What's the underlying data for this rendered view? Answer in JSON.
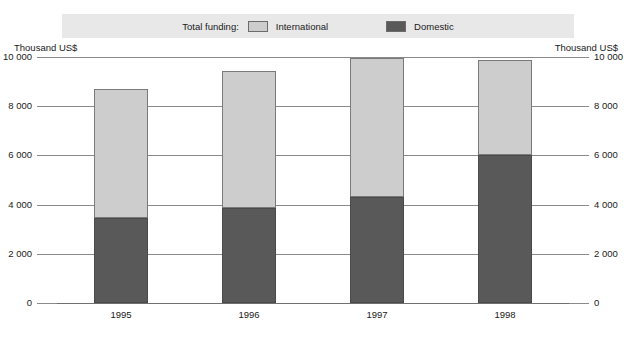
{
  "legend": {
    "title": "Total funding:",
    "entries": [
      {
        "label": "International",
        "swatch": "international-swatch",
        "color": "#cdcdcd"
      },
      {
        "label": "Domestic",
        "swatch": "domestic-swatch",
        "color": "#595959"
      }
    ]
  },
  "axes": {
    "left_caption": "Thousand US$",
    "right_caption": "Thousand US$",
    "tick_labels": [
      "10 000",
      "8 000",
      "6 000",
      "4 000",
      "2 000",
      "0"
    ]
  },
  "chart_data": {
    "type": "bar",
    "stacked": true,
    "title": "",
    "subtitle": "",
    "xlabel": "",
    "ylabel": "Thousand US$",
    "ylim": [
      0,
      10000
    ],
    "yticks": [
      0,
      2000,
      4000,
      6000,
      8000,
      10000
    ],
    "ytick_labels": [
      "0",
      "2 000",
      "4 000",
      "6 000",
      "8 000",
      "10 000"
    ],
    "grid": true,
    "legend_position": "top",
    "dual_axis": true,
    "categories": [
      "1995",
      "1996",
      "1997",
      "1998"
    ],
    "series": [
      {
        "name": "Domestic",
        "color": "#595959",
        "values": [
          3460,
          3860,
          4310,
          6020
        ]
      },
      {
        "name": "International",
        "color": "#cdcdcd",
        "values": [
          5240,
          5570,
          5650,
          3860
        ]
      }
    ],
    "totals": [
      8700,
      9430,
      9960,
      9880
    ]
  }
}
